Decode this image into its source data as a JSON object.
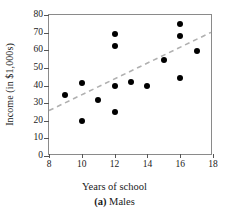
{
  "figure": {
    "caption_label": "(a)",
    "caption_text": "Males"
  },
  "chart_data": {
    "type": "scatter",
    "title": "",
    "xlabel": "Years of school",
    "ylabel": "Income (in $1,000s)",
    "xlim": [
      8,
      18
    ],
    "ylim": [
      0,
      80
    ],
    "xticks": [
      8,
      10,
      12,
      14,
      16,
      18
    ],
    "xtick_labels": [
      "8",
      "10",
      "12",
      "14",
      "16",
      "18"
    ],
    "yticks": [
      0,
      10,
      20,
      30,
      40,
      50,
      60,
      70,
      80
    ],
    "ytick_labels": [
      "0",
      "10",
      "20",
      "30",
      "40",
      "50",
      "60",
      "70",
      "80"
    ],
    "grid": false,
    "legend": false,
    "marker_color": "#000000",
    "marker_shape": "circle",
    "points": [
      {
        "x": 9,
        "y": 34.5
      },
      {
        "x": 10,
        "y": 41.5
      },
      {
        "x": 10,
        "y": 20.0
      },
      {
        "x": 11,
        "y": 32.0
      },
      {
        "x": 12,
        "y": 69.5
      },
      {
        "x": 12,
        "y": 62.5
      },
      {
        "x": 12,
        "y": 40.0
      },
      {
        "x": 12,
        "y": 25.0
      },
      {
        "x": 13,
        "y": 42.0
      },
      {
        "x": 14,
        "y": 40.0
      },
      {
        "x": 15,
        "y": 54.5
      },
      {
        "x": 16,
        "y": 75.0
      },
      {
        "x": 16,
        "y": 68.0
      },
      {
        "x": 16,
        "y": 44.5
      },
      {
        "x": 17,
        "y": 59.5
      }
    ],
    "trend_line": {
      "style": "dashed",
      "color": "#b0b0b0",
      "x1": 8,
      "y1": 25.0,
      "x2": 18,
      "y2": 70.0
    }
  }
}
